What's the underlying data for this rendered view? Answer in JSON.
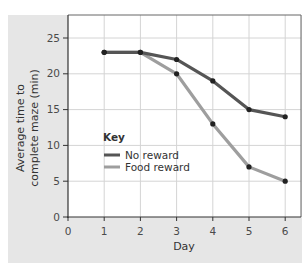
{
  "chart_data": {
    "type": "line",
    "title": "",
    "xlabel": "Day",
    "ylabel": "Average time to complete maze (min)",
    "ylabel_lines": [
      "Average time to",
      "complete maze (min)"
    ],
    "x": [
      1,
      2,
      3,
      4,
      5,
      6
    ],
    "xticks": [
      0,
      1,
      2,
      3,
      4,
      5,
      6
    ],
    "yticks": [
      0,
      5,
      10,
      15,
      20,
      25
    ],
    "xlim": [
      0,
      6.45
    ],
    "ylim": [
      0,
      28.2
    ],
    "grid": true,
    "legend_title": "Key",
    "legend_position": "center-left inside plot",
    "series": [
      {
        "name": "No reward",
        "color": "#555555",
        "values": [
          23,
          23,
          22,
          19,
          15,
          14
        ]
      },
      {
        "name": "Food reward",
        "color": "#9e9e9e",
        "values": [
          23,
          23,
          20,
          13,
          7,
          5
        ]
      }
    ]
  },
  "legend": {
    "title": "Key",
    "items": [
      {
        "label": "No reward",
        "color": "#555555"
      },
      {
        "label": "Food reward",
        "color": "#9e9e9e"
      }
    ]
  },
  "axes": {
    "x_title": "Day",
    "y_title_line1": "Average time to",
    "y_title_line2": "complete maze (min)"
  }
}
